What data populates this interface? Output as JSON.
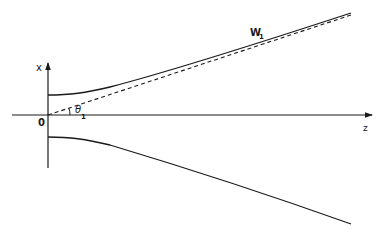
{
  "diagram": {
    "type": "gaussian-beam-profile",
    "axes": {
      "horizontal_label": "z",
      "vertical_label": "x",
      "origin_label": "0"
    },
    "curves": {
      "beam_width_label": "W",
      "beam_width_subscript": "1",
      "angle_label": "θ",
      "angle_subscript": "1",
      "asymptote_style": "dashed"
    },
    "colors": {
      "line": "#1a1a1a",
      "background": "#ffffff"
    }
  }
}
